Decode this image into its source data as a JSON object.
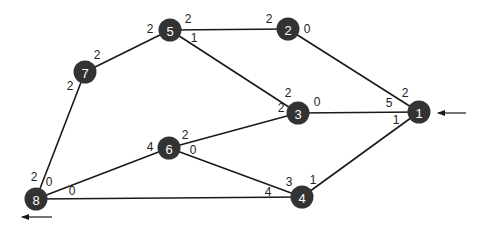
{
  "diagram": {
    "type": "weighted-graph",
    "colors": {
      "node_fill": "#333333",
      "node_text": "#ffffff",
      "edge": "#1a1a1a",
      "label": "#222222"
    },
    "nodes": [
      {
        "id": "1",
        "label": "1",
        "x": 419,
        "y": 112
      },
      {
        "id": "2",
        "label": "2",
        "x": 288,
        "y": 29
      },
      {
        "id": "3",
        "label": "3",
        "x": 298,
        "y": 113
      },
      {
        "id": "4",
        "label": "4",
        "x": 302,
        "y": 197
      },
      {
        "id": "5",
        "label": "5",
        "x": 170,
        "y": 30
      },
      {
        "id": "6",
        "label": "6",
        "x": 169,
        "y": 148
      },
      {
        "id": "7",
        "label": "7",
        "x": 85,
        "y": 72
      },
      {
        "id": "8",
        "label": "8",
        "x": 36,
        "y": 199
      }
    ],
    "edges": [
      {
        "from": "5",
        "to": "2"
      },
      {
        "from": "5",
        "to": "7"
      },
      {
        "from": "5",
        "to": "3"
      },
      {
        "from": "2",
        "to": "1"
      },
      {
        "from": "7",
        "to": "8"
      },
      {
        "from": "3",
        "to": "1"
      },
      {
        "from": "3",
        "to": "6"
      },
      {
        "from": "6",
        "to": "8"
      },
      {
        "from": "6",
        "to": "4"
      },
      {
        "from": "8",
        "to": "4"
      },
      {
        "from": "4",
        "to": "1"
      }
    ],
    "edge_labels": [
      {
        "text": "2",
        "x": 150,
        "y": 29
      },
      {
        "text": "2",
        "x": 188,
        "y": 19
      },
      {
        "text": "1",
        "x": 194,
        "y": 38
      },
      {
        "text": "2",
        "x": 269,
        "y": 19
      },
      {
        "text": "0",
        "x": 307,
        "y": 29
      },
      {
        "text": "2",
        "x": 97,
        "y": 55
      },
      {
        "text": "2",
        "x": 70,
        "y": 86
      },
      {
        "text": "2",
        "x": 288,
        "y": 93
      },
      {
        "text": "2",
        "x": 281,
        "y": 108
      },
      {
        "text": "0",
        "x": 317,
        "y": 102
      },
      {
        "text": "5",
        "x": 389,
        "y": 103
      },
      {
        "text": "2",
        "x": 405,
        "y": 93
      },
      {
        "text": "1",
        "x": 396,
        "y": 120
      },
      {
        "text": "4",
        "x": 150,
        "y": 147
      },
      {
        "text": "2",
        "x": 185,
        "y": 135
      },
      {
        "text": "0",
        "x": 193,
        "y": 150
      },
      {
        "text": "2",
        "x": 34,
        "y": 177
      },
      {
        "text": "0",
        "x": 49,
        "y": 182
      },
      {
        "text": "0",
        "x": 72,
        "y": 191
      },
      {
        "text": "4",
        "x": 268,
        "y": 192
      },
      {
        "text": "3",
        "x": 289,
        "y": 182
      },
      {
        "text": "1",
        "x": 313,
        "y": 180
      }
    ],
    "arrows": [
      {
        "name": "input-arrow-to-node-1",
        "x1": 466,
        "y1": 113,
        "x2": 438,
        "y2": 113
      },
      {
        "name": "output-arrow-from-node-8",
        "x1": 52,
        "y1": 217,
        "x2": 22,
        "y2": 217
      }
    ]
  }
}
